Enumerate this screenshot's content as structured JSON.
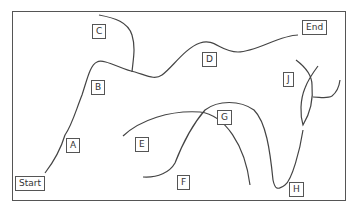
{
  "diagram": {
    "stroke_color": "#444444",
    "labels": [
      {
        "id": "start",
        "text": "Start",
        "x": 15,
        "y": 176
      },
      {
        "id": "a",
        "text": "A",
        "x": 66,
        "y": 138
      },
      {
        "id": "b",
        "text": "B",
        "x": 91,
        "y": 80
      },
      {
        "id": "c",
        "text": "C",
        "x": 92,
        "y": 24
      },
      {
        "id": "d",
        "text": "D",
        "x": 202,
        "y": 52
      },
      {
        "id": "e",
        "text": "E",
        "x": 135,
        "y": 137
      },
      {
        "id": "f",
        "text": "F",
        "x": 177,
        "y": 175
      },
      {
        "id": "g",
        "text": "G",
        "x": 217,
        "y": 110
      },
      {
        "id": "h",
        "text": "H",
        "x": 289,
        "y": 182
      },
      {
        "id": "j",
        "text": "J",
        "x": 283,
        "y": 72
      },
      {
        "id": "end",
        "text": "End",
        "x": 302,
        "y": 20
      }
    ],
    "paths": [
      {
        "id": "main-route",
        "d": "M45,173 C55,160 62,145 65,135 C72,125 76,110 82,95 C87,80 90,65 97,62 C104,58 122,70 135,72 C148,76 155,80 162,75 C172,68 185,48 200,43 C215,38 220,52 238,52 C256,52 280,35 298,35"
      },
      {
        "id": "curve-c",
        "d": "M99,15 C115,18 128,22 132,35 C136,48 133,60 132,72"
      },
      {
        "id": "curve-e",
        "d": "M123,136 C140,120 170,110 200,112 C225,115 245,145 250,185"
      },
      {
        "id": "curve-fg",
        "d": "M143,177 C158,178 170,172 175,163 C182,145 192,125 205,110 C218,100 240,100 254,110 C266,122 270,150 273,180 C275,190 278,190 285,185 C292,180 300,150 303,130"
      },
      {
        "id": "curve-j",
        "d": "M296,60 C304,66 312,75 312,85 C313,95 312,110 303,125 C300,115 300,100 305,88 C308,80 315,70 318,66"
      },
      {
        "id": "curve-j-right",
        "d": "M313,97 C320,97 327,99 332,96 C337,92 339,88 340,80"
      }
    ]
  }
}
